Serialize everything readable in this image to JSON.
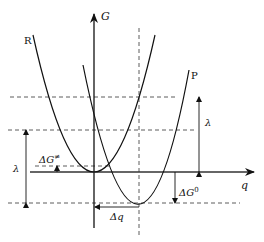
{
  "diagram": {
    "type": "marcus-parabolas",
    "axes": {
      "y_label": "G",
      "x_label": "q"
    },
    "curves": [
      {
        "name": "R",
        "label": "R",
        "minimum": [
          94,
          172
        ]
      },
      {
        "name": "P",
        "label": "P",
        "minimum": [
          139,
          203
        ]
      }
    ],
    "annotations": {
      "lambda_left": "λ",
      "lambda_right": "λ",
      "activation_energy": "ΔG",
      "activation_energy_sup": "≠",
      "reaction_energy": "ΔG",
      "reaction_energy_sup": "0",
      "displacement": "Δq"
    },
    "colors": {
      "line": "#111111",
      "dashed": "#333333",
      "background": "#ffffff"
    }
  }
}
